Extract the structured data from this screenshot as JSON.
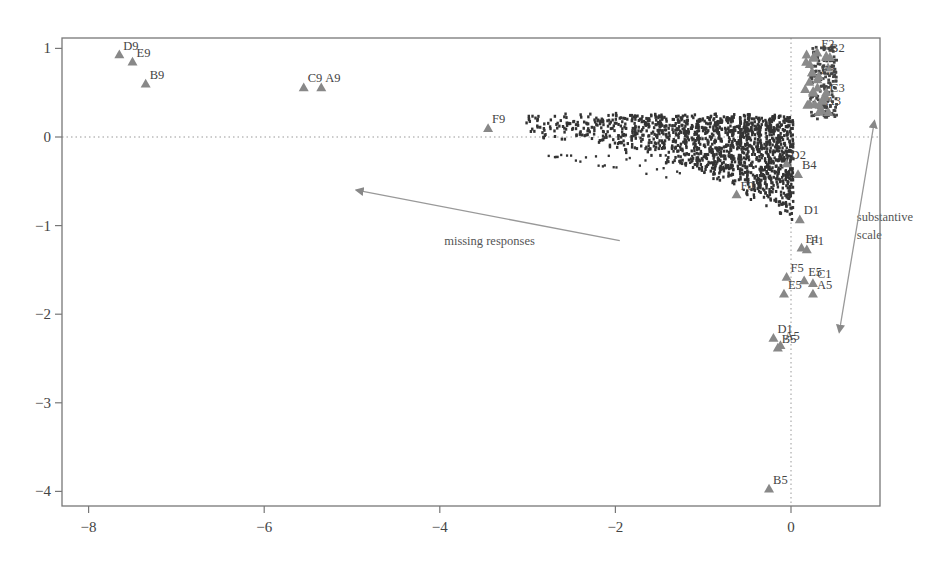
{
  "chart_data": {
    "type": "scatter",
    "title": "",
    "xlabel": "",
    "ylabel": "",
    "xlim": [
      -8.75,
      1.05
    ],
    "ylim": [
      -4.2,
      1.12
    ],
    "xticks": [
      -8,
      -6,
      -4,
      -2,
      0
    ],
    "xtick_labels": [
      "−8",
      "−6",
      "−4",
      "−2",
      "0"
    ],
    "yticks": [
      1,
      0,
      -1,
      -2,
      -3,
      -4
    ],
    "ytick_labels": [
      "1",
      "0",
      "−1",
      "−2",
      "−3",
      "−4"
    ],
    "grid": false,
    "reference_lines": [
      {
        "orientation": "horizontal",
        "value": 0,
        "style": "dotted"
      },
      {
        "orientation": "vertical",
        "value": 0,
        "style": "dotted"
      }
    ],
    "legend": null,
    "series": [
      {
        "name": "category points",
        "marker": "triangle",
        "color": "#888888",
        "points": [
          {
            "label": "D9",
            "x": -7.65,
            "y": 0.93
          },
          {
            "label": "E9",
            "x": -7.5,
            "y": 0.85
          },
          {
            "label": "B9",
            "x": -7.35,
            "y": 0.6
          },
          {
            "label": "C9",
            "x": -5.55,
            "y": 0.56
          },
          {
            "label": "A9",
            "x": -5.35,
            "y": 0.56
          },
          {
            "label": "F9",
            "x": -3.45,
            "y": 0.1
          },
          {
            "label": "F0",
            "x": -0.62,
            "y": -0.65
          },
          {
            "label": "D2",
            "x": -0.05,
            "y": -0.3
          },
          {
            "label": "B4",
            "x": 0.08,
            "y": -0.42
          },
          {
            "label": "D1",
            "x": 0.1,
            "y": -0.93
          },
          {
            "label": "E1",
            "x": 0.12,
            "y": -1.25
          },
          {
            "label": "F1",
            "x": 0.18,
            "y": -1.27
          },
          {
            "label": "F5",
            "x": -0.05,
            "y": -1.58
          },
          {
            "label": "E5",
            "x": 0.15,
            "y": -1.62
          },
          {
            "label": "C1",
            "x": 0.25,
            "y": -1.65
          },
          {
            "label": "E5",
            "x": -0.08,
            "y": -1.77
          },
          {
            "label": "A5",
            "x": 0.25,
            "y": -1.77
          },
          {
            "label": "D1",
            "x": -0.2,
            "y": -2.27
          },
          {
            "label": "A5",
            "x": -0.12,
            "y": -2.35
          },
          {
            "label": "B5",
            "x": -0.15,
            "y": -2.38
          },
          {
            "label": "B5",
            "x": -0.25,
            "y": -3.97
          },
          {
            "label": "F2",
            "x": 0.3,
            "y": 0.95
          },
          {
            "label": "B2",
            "x": 0.4,
            "y": 0.9
          },
          {
            "label": "E3",
            "x": 0.3,
            "y": 0.65
          },
          {
            "label": "C3",
            "x": 0.4,
            "y": 0.45
          },
          {
            "label": "A3",
            "x": 0.35,
            "y": 0.3
          }
        ]
      },
      {
        "name": "respondents",
        "marker": "dot",
        "color": "#333333",
        "description": "Dense cloud of small dark dots fanning from x≈-3 (y≈0.1) toward x≈0 (y from 0.25 down to -0.8), forming vertical streaks"
      }
    ],
    "annotations": [
      {
        "text": "missing responses",
        "x": -3.95,
        "y": -1.22,
        "arrow_from": [
          -1.95,
          -1.17
        ],
        "arrow_to": [
          -4.95,
          -0.6
        ]
      },
      {
        "text": "substantive",
        "x": 0.75,
        "y": -0.95
      },
      {
        "text": "scale",
        "x": 0.75,
        "y": -1.15
      },
      {
        "annotation": "substantive scale arrow",
        "arrow_from": [
          0.95,
          0.18
        ],
        "arrow_to": [
          0.55,
          -2.2
        ],
        "double_headed": true
      }
    ]
  }
}
